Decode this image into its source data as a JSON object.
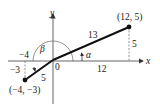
{
  "diagram": {
    "axes": {
      "x_label": "x",
      "y_label": "y",
      "origin_label": "0"
    },
    "points": [
      {
        "label": "(12, 5)",
        "x": 12,
        "y": 5
      },
      {
        "label": "(−4, −3)",
        "x": -4,
        "y": -3
      }
    ],
    "segments": [
      {
        "from": "origin",
        "to": "(12, 5)",
        "length_label": "13"
      },
      {
        "from": "origin",
        "to": "(−4, −3)",
        "length_label": "5"
      }
    ],
    "angles": [
      {
        "label": "α",
        "description": "angle from positive x-axis to segment to (12,5)"
      },
      {
        "label": "β",
        "description": "angle from positive x-axis to segment to (-4,-3)"
      }
    ],
    "dimension_labels": {
      "horizontal_12": "12",
      "vertical_5": "5",
      "horizontal_neg4": "−4",
      "vertical_neg3": "−3"
    }
  }
}
